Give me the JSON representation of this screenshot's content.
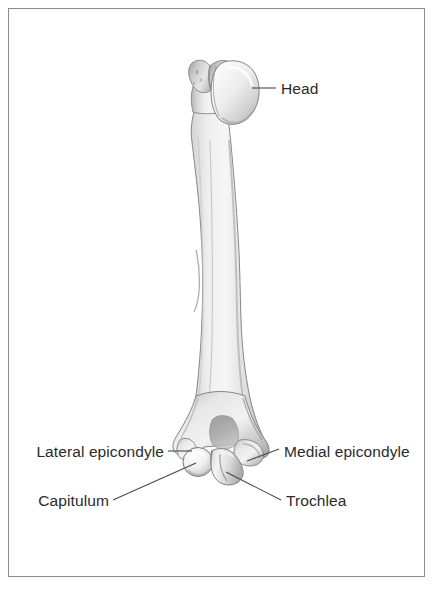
{
  "figure": {
    "background_color": "#ffffff",
    "frame_border_color": "#8b8b8b",
    "label_text_color": "#2b2b2b",
    "leader_line_color": "#4a4a4a",
    "bone_fill_light": "#f2f2f2",
    "bone_fill_mid": "#c9c9c9",
    "bone_fill_dark": "#9a9a9a",
    "bone_outline": "#6e6e6e"
  },
  "labels": {
    "head": "Head",
    "lateral_epicondyle": "Lateral epicondyle",
    "medial_epicondyle": "Medial epicondyle",
    "capitulum": "Capitulum",
    "trochlea": "Trochlea"
  }
}
